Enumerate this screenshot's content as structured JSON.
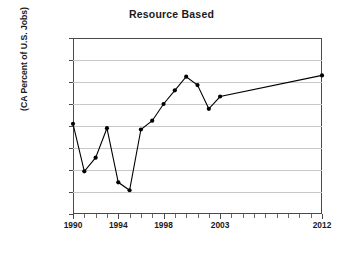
{
  "chart_data": {
    "type": "line",
    "title": "Resource Based",
    "xlabel": "",
    "ylabel": "(CA Percent of U.S. Jobs)",
    "ylim": [
      13.0,
      17.0
    ],
    "ytick_step": 0.5,
    "ytick_labels": [
      "17.0%",
      "16.5%",
      "16.0%",
      "15.5%",
      "15.0%",
      "14.5%",
      "14.0%",
      "13.5%",
      "13.0%"
    ],
    "ytick_values": [
      17.0,
      16.5,
      16.0,
      15.5,
      15.0,
      14.5,
      14.0,
      13.5,
      13.0
    ],
    "xtick_labels": [
      "1990",
      "1994",
      "1998",
      "2003",
      "2012"
    ],
    "xtick_values": [
      1990,
      1994,
      1998,
      2003,
      2012
    ],
    "grid": "horizontal",
    "legend": "none",
    "marker": "filled-diamond",
    "line_color": "#000000",
    "grid_color": "#c8c8c8",
    "axis_color": "#4a4a4a",
    "x": [
      1990,
      1991,
      1992,
      1993,
      1994,
      1995,
      1996,
      1997,
      1998,
      1999,
      2000,
      2001,
      2002,
      2003,
      2012
    ],
    "values": [
      15.05,
      13.97,
      14.28,
      14.95,
      13.72,
      13.54,
      14.92,
      15.12,
      15.5,
      15.81,
      16.12,
      15.93,
      15.39,
      15.67,
      16.15
    ],
    "series": [
      {
        "name": "Resource Based",
        "values": [
          15.05,
          13.97,
          14.28,
          14.95,
          13.72,
          13.54,
          14.92,
          15.12,
          15.5,
          15.81,
          16.12,
          15.93,
          15.39,
          15.67,
          16.15
        ]
      }
    ]
  }
}
